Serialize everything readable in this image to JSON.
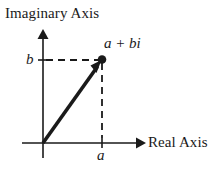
{
  "figure": {
    "type": "complex-plane-diagram",
    "background_color": "#ffffff",
    "ink_color": "#1a1a1a",
    "width": 221,
    "height": 177
  },
  "axes": {
    "vertical": {
      "title": "Imaginary Axis",
      "name": "imaginary-axis",
      "arrow": "up"
    },
    "horizontal": {
      "title": "Real Axis",
      "name": "real-axis",
      "arrow": "right"
    },
    "origin": {
      "x": 43,
      "y": 143
    }
  },
  "point": {
    "label": "a + bi",
    "x": 102,
    "y": 60,
    "marker": "filled-dot"
  },
  "ticks": {
    "imaginary": {
      "label": "b",
      "x": 43,
      "y": 60
    },
    "real": {
      "label": "a",
      "x": 102,
      "y": 143
    }
  },
  "guides": {
    "horizontal_dashed": {
      "from_x": 43,
      "to_x": 102,
      "y": 60
    },
    "vertical_dashed": {
      "x": 102,
      "from_y": 60,
      "to_y": 143
    }
  },
  "vector": {
    "name": "position-vector",
    "from": {
      "x": 43,
      "y": 143
    },
    "to": {
      "x": 102,
      "y": 60
    }
  }
}
